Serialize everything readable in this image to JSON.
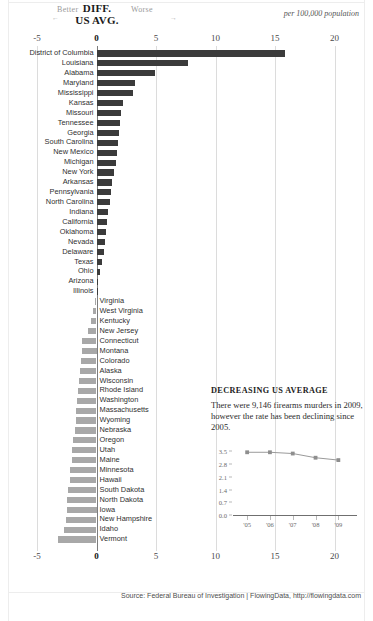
{
  "header": {
    "better_label": "Better",
    "better_arrow": "←",
    "worse_label": "Worse",
    "worse_arrow": "→",
    "title_line1": "DIFF.",
    "title_line2": "US AVG.",
    "units": "per 100,000 population"
  },
  "source": "Source: Federal Bureau of Investigation | FlowingData, http://flowingdata.com",
  "inset": {
    "heading": "DECREASING US AVERAGE",
    "body": "There were 9,146 firearms murders in 2009, however the rate has been declining since 2005."
  },
  "chart_data": {
    "type": "bar",
    "title": "DIFF. US AVG.",
    "xlabel": "per 100,000 population",
    "ylabel": "",
    "orientation": "horizontal",
    "xlim": [
      -5,
      20
    ],
    "xticks": [
      -5,
      0,
      5,
      10,
      15,
      20
    ],
    "xtick_labels": [
      "-5",
      "0",
      "5",
      "10",
      "15",
      "20"
    ],
    "grid": true,
    "zero_line": 0,
    "positive_color": "#3b3b3b",
    "negative_color": "#a8a8a8",
    "categories": [
      "District of Columbia",
      "Louisiana",
      "Alabama",
      "Maryland",
      "Mississippi",
      "Kansas",
      "Missouri",
      "Tennessee",
      "Georgia",
      "South Carolina",
      "New Mexico",
      "Michigan",
      "New York",
      "Arkansas",
      "Pennsylvania",
      "North Carolina",
      "Indiana",
      "California",
      "Oklahoma",
      "Nevada",
      "Delaware",
      "Texas",
      "Ohio",
      "Arizona",
      "Illinois",
      "Virginia",
      "West Virginia",
      "Kentucky",
      "New Jersey",
      "Connecticut",
      "Montana",
      "Colorado",
      "Alaska",
      "Wisconsin",
      "Rhode Island",
      "Washington",
      "Massachusetts",
      "Wyoming",
      "Nebraska",
      "Oregon",
      "Utah",
      "Maine",
      "Minnesota",
      "Hawaii",
      "South Dakota",
      "North Dakota",
      "Iowa",
      "New Hampshire",
      "Idaho",
      "Vermont"
    ],
    "values": [
      15.8,
      7.7,
      4.9,
      3.2,
      3.1,
      2.2,
      2.1,
      2.0,
      1.9,
      1.8,
      1.7,
      1.6,
      1.5,
      1.3,
      1.2,
      1.1,
      1.0,
      0.9,
      0.8,
      0.7,
      0.6,
      0.5,
      0.3,
      0.05,
      0.02,
      -0.15,
      -0.3,
      -0.45,
      -0.7,
      -1.2,
      -1.25,
      -1.3,
      -1.35,
      -1.5,
      -1.55,
      -1.6,
      -1.7,
      -1.75,
      -1.8,
      -2.0,
      -2.05,
      -2.1,
      -2.2,
      -2.25,
      -2.4,
      -2.45,
      -2.5,
      -2.6,
      -2.7,
      -3.2
    ]
  },
  "inset_chart_data": {
    "type": "line",
    "title": "DECREASING US AVERAGE",
    "x": [
      "'05",
      "'06",
      "'07",
      "'08",
      "'09"
    ],
    "values": [
      3.45,
      3.45,
      3.38,
      3.15,
      3.02
    ],
    "yticks": [
      0.0,
      0.7,
      1.4,
      2.1,
      2.8,
      3.5
    ],
    "ytick_labels": [
      "0.0",
      "0.7",
      "1.4",
      "2.1",
      "2.8",
      "3.5"
    ],
    "ylim": [
      0,
      3.85
    ],
    "xlabel": "",
    "ylabel": "",
    "grid": false,
    "line_color": "#9a9a9a",
    "marker_color": "#8e8e8e"
  }
}
